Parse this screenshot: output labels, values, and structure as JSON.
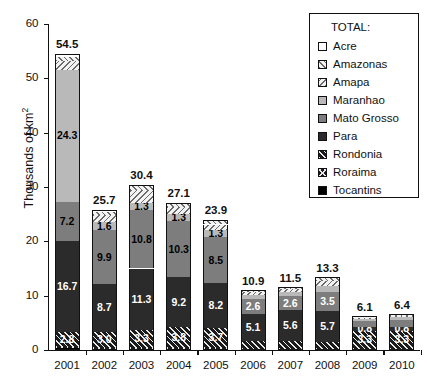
{
  "chart_data": {
    "type": "bar",
    "title": "",
    "subtitle": "",
    "xlabel": "",
    "ylabel": "Thousands of km2",
    "ylabel_display": "Thousands of km",
    "ylabel_sup": "2",
    "ylim": [
      0,
      60
    ],
    "yticks": [
      0,
      10,
      20,
      30,
      40,
      50,
      60
    ],
    "grid": false,
    "stacked": true,
    "legend_position": "top-right",
    "legend_title": "TOTAL:",
    "categories": [
      "2001",
      "2002",
      "2003",
      "2004",
      "2005",
      "2006",
      "2007",
      "2008",
      "2009",
      "2010"
    ],
    "totals": [
      54.5,
      25.7,
      30.4,
      27.1,
      23.9,
      10.9,
      11.5,
      13.3,
      6.1,
      6.4
    ],
    "series": [
      {
        "name": "Tocantins",
        "key": "tocantins",
        "color": "#000000",
        "pattern": "solid",
        "values": [
          0.3,
          0.2,
          0.2,
          0.2,
          0.2,
          0.1,
          0.1,
          0.1,
          0.1,
          0.1
        ],
        "labels": [
          "",
          "",
          "",
          "",
          "",
          "",
          "",
          "",
          "",
          ""
        ]
      },
      {
        "name": "Roraima",
        "key": "roraima",
        "color": "#1a1a1a",
        "pattern": "crosshatch",
        "values": [
          0.3,
          0.2,
          0.2,
          0.2,
          0.2,
          0.1,
          0.1,
          0.1,
          0.1,
          0.1
        ],
        "labels": [
          "",
          "",
          "",
          "",
          "",
          "",
          "",
          "",
          "",
          ""
        ]
      },
      {
        "name": "Rondonia",
        "key": "rondonia",
        "color": "#1a1a1a",
        "pattern": "hatch",
        "values": [
          2.8,
          3.0,
          3.3,
          3.8,
          3.7,
          1.4,
          1.5,
          1.3,
          3.3,
          3.3
        ],
        "labels": [
          "2.8",
          "3.0",
          "3.3",
          "3.8",
          "3.7",
          "",
          "",
          "",
          "3.3",
          "3.3"
        ]
      },
      {
        "name": "Para",
        "key": "para",
        "color": "#2b2b2b",
        "pattern": "solid",
        "values": [
          16.7,
          8.7,
          11.3,
          9.2,
          8.2,
          5.1,
          5.6,
          5.7,
          0.8,
          0.8
        ],
        "labels": [
          "16.7",
          "8.7",
          "11.3",
          "9.2",
          "8.2",
          "5.1",
          "5.6",
          "5.7",
          "0.8",
          "0.8"
        ]
      },
      {
        "name": "Mato Grosso",
        "key": "matogrosso",
        "color": "#7d7d7d",
        "pattern": "solid",
        "values": [
          7.2,
          9.9,
          10.8,
          10.3,
          8.5,
          2.6,
          2.6,
          3.5,
          1.0,
          1.3
        ],
        "labels": [
          "7.2",
          "9.9",
          "10.8",
          "10.3",
          "8.5",
          "2.6",
          "2.6",
          "3.5",
          "",
          ""
        ]
      },
      {
        "name": "Maranhao",
        "key": "maranhao",
        "color": "#b9b9b9",
        "pattern": "solid",
        "values": [
          24.3,
          1.6,
          1.3,
          1.3,
          1.3,
          0.8,
          0.8,
          1.0,
          0.4,
          0.4
        ],
        "labels": [
          "24.3",
          "1.6",
          "1.3",
          "1.3",
          "1.3",
          "",
          "",
          "",
          "",
          ""
        ]
      },
      {
        "name": "Amapa",
        "key": "amapa",
        "color": "#f2f2f2",
        "pattern": "hatch-back",
        "values": [
          1.6,
          1.3,
          2.3,
          1.3,
          1.0,
          0.5,
          0.5,
          1.0,
          0.3,
          0.3
        ],
        "labels": [
          "",
          "",
          "",
          "",
          "",
          "",
          "",
          "",
          "",
          ""
        ]
      },
      {
        "name": "Amazonas",
        "key": "amazonas",
        "color": "#f2f2f2",
        "pattern": "hatch-fwd",
        "values": [
          0.8,
          0.5,
          0.8,
          0.6,
          0.6,
          0.2,
          0.2,
          0.5,
          0.1,
          0.1
        ],
        "labels": [
          "",
          "",
          "",
          "",
          "",
          "",
          "",
          "",
          "",
          ""
        ]
      },
      {
        "name": "Acre",
        "key": "acre",
        "color": "#ffffff",
        "pattern": "solid",
        "values": [
          0.5,
          0.3,
          0.2,
          0.2,
          0.2,
          0.1,
          0.1,
          0.1,
          0.1,
          0.1
        ],
        "labels": [
          "",
          "",
          "",
          "",
          "",
          "",
          "",
          "",
          "",
          ""
        ]
      }
    ],
    "legend_entries": [
      {
        "label": "Acre",
        "key": "acre"
      },
      {
        "label": "Amazonas",
        "key": "amazonas"
      },
      {
        "label": "Amapa",
        "key": "amapa"
      },
      {
        "label": "Maranhao",
        "key": "maranhao"
      },
      {
        "label": "Mato Grosso",
        "key": "matogrosso"
      },
      {
        "label": "Para",
        "key": "para"
      },
      {
        "label": "Rondonia",
        "key": "rondonia"
      },
      {
        "label": "Roraima",
        "key": "roraima"
      },
      {
        "label": "Tocantins",
        "key": "tocantins"
      }
    ]
  }
}
